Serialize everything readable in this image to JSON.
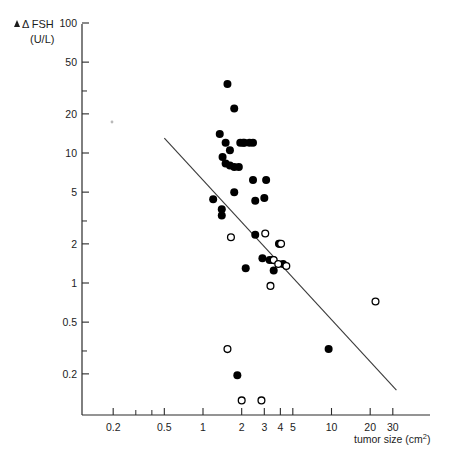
{
  "figure": {
    "background_color": "#ffffff",
    "ink_color": "#000000"
  },
  "yaxis": {
    "label_line1": "Δ FSH",
    "label_line2": "(U/L)",
    "scale": "log",
    "ticks": [
      {
        "value": 100,
        "label": "100"
      },
      {
        "value": 50,
        "label": "50"
      },
      {
        "value": 30,
        "label": ""
      },
      {
        "value": 20,
        "label": "20"
      },
      {
        "value": 10,
        "label": "10"
      },
      {
        "value": 5,
        "label": "5"
      },
      {
        "value": 3,
        "label": ""
      },
      {
        "value": 2,
        "label": "2"
      },
      {
        "value": 1,
        "label": "1"
      },
      {
        "value": 0.5,
        "label": "0.5"
      },
      {
        "value": 0.3,
        "label": ""
      },
      {
        "value": 0.2,
        "label": "0.2"
      }
    ],
    "range": [
      0.1,
      100
    ]
  },
  "xaxis": {
    "label": "tumor size (cm²)",
    "scale": "log",
    "ticks": [
      {
        "value": 0.2,
        "label": "0.2"
      },
      {
        "value": 0.3,
        "label": ""
      },
      {
        "value": 0.4,
        "label": ""
      },
      {
        "value": 0.5,
        "label": "0.5"
      },
      {
        "value": 1,
        "label": "1"
      },
      {
        "value": 2,
        "label": "2"
      },
      {
        "value": 3,
        "label": "3"
      },
      {
        "value": 4,
        "label": "4"
      },
      {
        "value": 5,
        "label": "5"
      },
      {
        "value": 10,
        "label": "10"
      },
      {
        "value": 20,
        "label": "20"
      },
      {
        "value": 30,
        "label": "30"
      }
    ],
    "range": [
      0.15,
      55
    ]
  },
  "chart_data": {
    "type": "scatter",
    "title": "",
    "xlabel": "tumor size (cm²)",
    "ylabel": "Δ FSH (U/L)",
    "xscale": "log",
    "yscale": "log",
    "xlim": [
      0.15,
      55
    ],
    "ylim": [
      0.1,
      100
    ],
    "grid": false,
    "legend": "none",
    "series": [
      {
        "name": "filled-circles",
        "marker": "filled circle",
        "color": "#000000",
        "points": [
          {
            "x": 1.55,
            "y": 34.0
          },
          {
            "x": 1.75,
            "y": 22.0
          },
          {
            "x": 1.35,
            "y": 14.0
          },
          {
            "x": 1.5,
            "y": 12.0
          },
          {
            "x": 1.95,
            "y": 12.0
          },
          {
            "x": 2.1,
            "y": 12.0
          },
          {
            "x": 2.3,
            "y": 12.0
          },
          {
            "x": 2.45,
            "y": 12.0
          },
          {
            "x": 1.42,
            "y": 9.3
          },
          {
            "x": 1.5,
            "y": 8.3
          },
          {
            "x": 1.62,
            "y": 8.0
          },
          {
            "x": 1.75,
            "y": 7.8
          },
          {
            "x": 1.9,
            "y": 7.8
          },
          {
            "x": 1.62,
            "y": 10.5
          },
          {
            "x": 2.45,
            "y": 6.2
          },
          {
            "x": 3.1,
            "y": 6.2
          },
          {
            "x": 1.75,
            "y": 5.0
          },
          {
            "x": 1.2,
            "y": 4.4
          },
          {
            "x": 1.4,
            "y": 3.7
          },
          {
            "x": 1.4,
            "y": 3.3
          },
          {
            "x": 2.55,
            "y": 4.3
          },
          {
            "x": 3.0,
            "y": 4.5
          },
          {
            "x": 2.55,
            "y": 2.35
          },
          {
            "x": 2.9,
            "y": 1.55
          },
          {
            "x": 3.3,
            "y": 1.5
          },
          {
            "x": 3.5,
            "y": 1.5
          },
          {
            "x": 3.55,
            "y": 1.25
          },
          {
            "x": 4.2,
            "y": 1.4
          },
          {
            "x": 3.9,
            "y": 2.0
          },
          {
            "x": 3.95,
            "y": 2.0
          },
          {
            "x": 2.15,
            "y": 1.3
          },
          {
            "x": 9.5,
            "y": 0.31
          },
          {
            "x": 1.85,
            "y": 0.195
          },
          {
            "x": 2.05,
            "y": 12.0
          }
        ]
      },
      {
        "name": "open-circles",
        "marker": "open circle",
        "color": "#ffffff",
        "points": [
          {
            "x": 1.65,
            "y": 2.25
          },
          {
            "x": 3.05,
            "y": 2.4
          },
          {
            "x": 4.05,
            "y": 2.0
          },
          {
            "x": 3.55,
            "y": 1.5
          },
          {
            "x": 3.85,
            "y": 1.4
          },
          {
            "x": 4.45,
            "y": 1.35
          },
          {
            "x": 3.35,
            "y": 0.95
          },
          {
            "x": 22.0,
            "y": 0.72
          },
          {
            "x": 1.55,
            "y": 0.31
          },
          {
            "x": 2.0,
            "y": 0.125
          },
          {
            "x": 2.85,
            "y": 0.125
          }
        ]
      }
    ],
    "regression_line": {
      "description": "fitted straight line on log-log axes",
      "x_start": 0.5,
      "y_start": 13.0,
      "x_end": 32.0,
      "y_end": 0.15,
      "color": "#3a3a3a"
    }
  }
}
